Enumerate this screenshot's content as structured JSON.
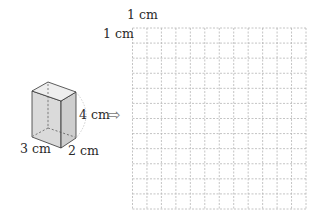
{
  "figure": {
    "box": {
      "shape": "rectangular-prism",
      "dimensions": {
        "length": "3 cm",
        "width": "2 cm",
        "height": "4 cm"
      },
      "labels": {
        "length": "3 cm",
        "width": "2 cm",
        "height": "4 cm"
      },
      "colors": {
        "front": "#d3d3d3",
        "side": "#c6c6c6",
        "top": "#eeeeee",
        "edge": "#333333"
      }
    },
    "arrow": "⇨",
    "grid": {
      "columns": 12,
      "rows": 12,
      "cell_label_x": "1 cm",
      "cell_label_y": "1 cm",
      "line_color": "#b5b5b5"
    }
  }
}
